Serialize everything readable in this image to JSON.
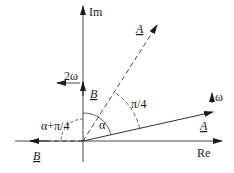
{
  "diagram": {
    "type": "phasor-diagram",
    "axes": {
      "real_label": "Re",
      "imag_label": "Im"
    },
    "phasors": [
      {
        "id": "A-rotated",
        "label": "A",
        "style": "dashed",
        "angle": "α+π/4"
      },
      {
        "id": "A",
        "label": "A",
        "style": "solid",
        "angle": "α"
      },
      {
        "id": "B",
        "label": "B",
        "style": "solid",
        "angle": "π/2"
      },
      {
        "id": "B-rotated",
        "label": "B",
        "style": "dashed",
        "angle": "π"
      }
    ],
    "rotation_labels": {
      "A": "ω",
      "B": "2ω"
    },
    "angle_labels": {
      "alpha": "α",
      "pi_over_4": "π/4",
      "alpha_plus_pi_over_4": "α+π/4"
    },
    "colors": {
      "line": "#1a1a1a",
      "background": "#ffffff"
    }
  }
}
